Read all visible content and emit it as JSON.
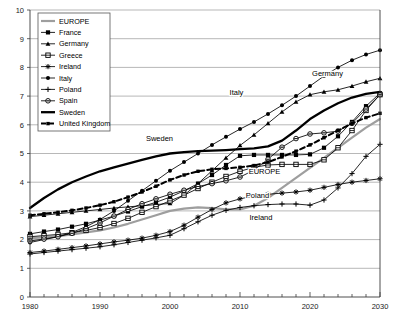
{
  "chart_data": {
    "type": "line",
    "title": "",
    "subtitle": "",
    "xlabel": "",
    "ylabel": "",
    "xlim": [
      1980,
      2030
    ],
    "ylim": [
      0,
      10
    ],
    "grid": true,
    "legend_position": "top-left",
    "x_ticks": [
      1980,
      1990,
      2000,
      2010,
      2020,
      2030
    ],
    "x_tick_labels": [
      "1980",
      "1990",
      "2000",
      "2010",
      "2020",
      "2030"
    ],
    "y_ticks": [
      0,
      1,
      2,
      3,
      4,
      5,
      6,
      7,
      8,
      9,
      10
    ],
    "y_tick_labels": [
      "0",
      "1",
      "2",
      "3",
      "4",
      "5",
      "6",
      "7",
      "8",
      "9",
      "10"
    ],
    "x": [
      1980,
      1982,
      1984,
      1986,
      1988,
      1990,
      1992,
      1994,
      1996,
      1998,
      2000,
      2002,
      2004,
      2006,
      2008,
      2010,
      2012,
      2014,
      2016,
      2018,
      2020,
      2022,
      2024,
      2026,
      2028,
      2030
    ],
    "series": [
      {
        "name": "EUROPE",
        "marker": "none",
        "line": "solid-thick-grey",
        "color": "#9e9e9e",
        "values": [
          2.05,
          2.08,
          2.12,
          2.18,
          2.25,
          2.32,
          2.42,
          2.55,
          2.7,
          2.85,
          3.0,
          3.08,
          3.12,
          3.1,
          3.05,
          3.05,
          3.18,
          3.45,
          3.8,
          4.15,
          4.5,
          4.85,
          5.2,
          5.55,
          5.9,
          6.2
        ]
      },
      {
        "name": "France",
        "marker": "square-filled",
        "line": "solid",
        "color": "#000000",
        "values": [
          2.2,
          2.28,
          2.35,
          2.45,
          2.55,
          2.68,
          2.82,
          2.98,
          3.15,
          3.3,
          3.48,
          3.7,
          3.95,
          4.25,
          4.6,
          4.92,
          4.95,
          4.95,
          4.95,
          4.95,
          4.97,
          5.2,
          5.6,
          6.1,
          6.65,
          7.1
        ]
      },
      {
        "name": "Germany",
        "marker": "triangle-filled",
        "line": "solid",
        "color": "#000000",
        "values": [
          2.8,
          2.85,
          2.9,
          2.95,
          3.0,
          3.05,
          3.1,
          3.14,
          3.18,
          3.22,
          3.26,
          3.55,
          3.95,
          4.4,
          4.85,
          5.28,
          5.65,
          6.05,
          6.45,
          6.8,
          7.05,
          7.15,
          7.22,
          7.35,
          7.5,
          7.62
        ]
      },
      {
        "name": "Greece",
        "marker": "square-open",
        "line": "solid",
        "color": "#000000",
        "values": [
          2.1,
          2.14,
          2.18,
          2.24,
          2.32,
          2.42,
          2.56,
          2.74,
          2.95,
          3.15,
          3.35,
          3.55,
          3.78,
          4.0,
          4.2,
          4.38,
          4.52,
          4.6,
          4.62,
          4.62,
          4.62,
          4.78,
          5.2,
          5.8,
          6.5,
          7.05
        ]
      },
      {
        "name": "Ireland",
        "marker": "star-cross",
        "line": "solid",
        "color": "#000000",
        "values": [
          1.55,
          1.6,
          1.66,
          1.72,
          1.78,
          1.85,
          1.92,
          1.98,
          2.05,
          2.15,
          2.28,
          2.5,
          2.78,
          3.05,
          3.28,
          3.42,
          3.52,
          3.58,
          3.62,
          3.66,
          3.72,
          3.82,
          3.92,
          4.0,
          4.06,
          4.12
        ]
      },
      {
        "name": "Italy",
        "marker": "circle-filled",
        "line": "solid",
        "color": "#000000",
        "values": [
          1.9,
          2.0,
          2.1,
          2.25,
          2.45,
          2.7,
          3.0,
          3.35,
          3.7,
          4.05,
          4.4,
          4.7,
          5.0,
          5.3,
          5.58,
          5.85,
          6.1,
          6.38,
          6.68,
          7.0,
          7.35,
          7.7,
          8.0,
          8.25,
          8.45,
          8.6
        ]
      },
      {
        "name": "Poland",
        "marker": "plus",
        "line": "solid",
        "color": "#000000",
        "values": [
          1.5,
          1.55,
          1.6,
          1.65,
          1.7,
          1.75,
          1.82,
          1.9,
          1.98,
          2.06,
          2.15,
          2.38,
          2.62,
          2.85,
          3.02,
          3.12,
          3.18,
          3.22,
          3.24,
          3.24,
          3.2,
          3.38,
          3.8,
          4.3,
          4.9,
          5.32
        ]
      },
      {
        "name": "Spain",
        "marker": "circle-open-dot",
        "line": "solid",
        "color": "#000000",
        "values": [
          1.95,
          2.02,
          2.1,
          2.22,
          2.38,
          2.58,
          2.82,
          3.05,
          3.25,
          3.42,
          3.58,
          3.72,
          3.85,
          3.95,
          4.05,
          4.18,
          4.42,
          4.8,
          5.22,
          5.52,
          5.68,
          5.72,
          5.78,
          6.05,
          6.55,
          7.05
        ]
      },
      {
        "name": "Sweden",
        "marker": "none",
        "line": "solid-heavy",
        "color": "#000000",
        "values": [
          3.1,
          3.45,
          3.75,
          4.0,
          4.2,
          4.38,
          4.52,
          4.65,
          4.78,
          4.9,
          5.0,
          5.05,
          5.08,
          5.1,
          5.12,
          5.15,
          5.18,
          5.25,
          5.45,
          5.8,
          6.2,
          6.5,
          6.75,
          6.95,
          7.08,
          7.15
        ]
      },
      {
        "name": "United Kingdom",
        "marker": "square-small",
        "line": "dashed-heavy",
        "color": "#000000",
        "values": [
          2.85,
          2.9,
          2.95,
          3.02,
          3.1,
          3.2,
          3.32,
          3.48,
          3.66,
          3.86,
          4.08,
          4.25,
          4.38,
          4.45,
          4.48,
          4.52,
          4.58,
          4.7,
          4.88,
          5.08,
          5.3,
          5.55,
          5.8,
          6.05,
          6.25,
          6.4
        ]
      }
    ],
    "annotations": [
      {
        "text": "Sweden",
        "x": 1998.5,
        "y": 5.42
      },
      {
        "text": "Italy",
        "x": 2009.5,
        "y": 7.05
      },
      {
        "text": "Germany",
        "x": 2022.5,
        "y": 7.7
      },
      {
        "text": "EUROPE",
        "x": 2013.5,
        "y": 4.28
      },
      {
        "text": "Poland",
        "x": 2012.5,
        "y": 3.45
      },
      {
        "text": "Ireland",
        "x": 2013.0,
        "y": 2.68
      }
    ]
  },
  "legend": {
    "items": [
      {
        "label": "EUROPE"
      },
      {
        "label": "France"
      },
      {
        "label": "Germany"
      },
      {
        "label": "Greece"
      },
      {
        "label": "Ireland"
      },
      {
        "label": "Italy"
      },
      {
        "label": "Poland"
      },
      {
        "label": "Spain"
      },
      {
        "label": "Sweden"
      },
      {
        "label": "United Kingdom"
      }
    ]
  }
}
